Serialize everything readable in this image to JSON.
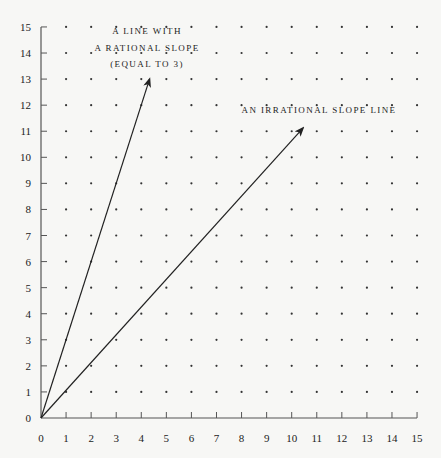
{
  "chart_data": {
    "type": "line",
    "title": "",
    "xlabel": "",
    "ylabel": "",
    "xlim": [
      0,
      15
    ],
    "ylim": [
      0,
      15
    ],
    "x_ticks": [
      0,
      1,
      2,
      3,
      4,
      5,
      6,
      7,
      8,
      9,
      10,
      11,
      12,
      13,
      14,
      15
    ],
    "y_ticks": [
      0,
      1,
      2,
      3,
      4,
      5,
      6,
      7,
      8,
      9,
      10,
      11,
      12,
      13,
      14,
      15
    ],
    "grid": "dots at every integer lattice point",
    "series": [
      {
        "name": "A line with a rational slope (equal to 3)",
        "slope": 3,
        "start": [
          0,
          0
        ],
        "end": [
          4.33,
          13
        ],
        "arrow": true
      },
      {
        "name": "An irrational slope line",
        "slope": 1.064,
        "start": [
          0,
          0
        ],
        "end": [
          10.45,
          11.12
        ],
        "arrow": true
      }
    ],
    "annotations": [
      {
        "lines": [
          "A LINE WITH",
          "A RATIONAL SLOPE",
          "(EQUAL TO 3)"
        ],
        "x": 4.3,
        "y": 14.3
      },
      {
        "lines": [
          "AN IRRATIONAL SLOPE LINE"
        ],
        "x": 11.9,
        "y": 11.9
      }
    ]
  },
  "labels": {
    "rational_line_1": "A LINE WITH",
    "rational_line_2": "A RATIONAL SLOPE",
    "rational_line_3": "(EQUAL TO 3)",
    "irrational_line": "AN IRRATIONAL SLOPE LINE"
  },
  "colors": {
    "background": "#f7f7f5",
    "ink": "#222222",
    "axis": "#555555",
    "dot": "#333333"
  }
}
